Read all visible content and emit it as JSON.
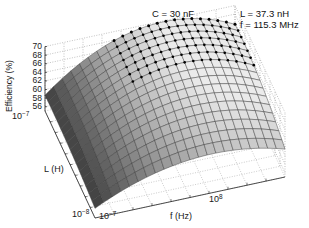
{
  "chart_data": {
    "type": "surface3d",
    "title": "C = 30 nF",
    "annotation": [
      "L = 37.3 nH",
      "f = 115.3 MHz"
    ],
    "xlabel": "f (Hz)",
    "ylabel": "L (H)",
    "zlabel": "Efficiency (%)",
    "x_scale": "log",
    "y_scale": "log",
    "x_ticks": [
      "10^-7",
      "10^8"
    ],
    "y_ticks": [
      "10^-7",
      "10^-8"
    ],
    "z_ticks": [
      56,
      58,
      60,
      62,
      64,
      66,
      68,
      70
    ],
    "zlim": [
      55,
      70
    ],
    "grid": true,
    "peak_marker": "dots along ridge",
    "surface_description": "Efficiency surface rising from ~55% at low f / high L corner to ~70% ridge, falling toward ~62% at high f edge",
    "grid_rows": 16,
    "grid_cols": 22
  },
  "title": "C = 30 nF",
  "annotation": {
    "line1": "L = 37.3 nH",
    "line2": "f = 115.3 MHz"
  },
  "axes": {
    "z_label": "Efficiency (%)",
    "z_ticks": [
      "70",
      "68",
      "66",
      "64",
      "62",
      "60",
      "58",
      "56"
    ],
    "l_label": "L (H)",
    "l_tick_top_base": "10",
    "l_tick_top_exp": "−7",
    "l_tick_bottom_base": "10",
    "l_tick_bottom_exp": "−8",
    "f_label": "f (Hz)",
    "f_tick_left_base": "10",
    "f_tick_left_exp": "−7",
    "f_tick_mid_base": "10",
    "f_tick_mid_exp": "8"
  }
}
